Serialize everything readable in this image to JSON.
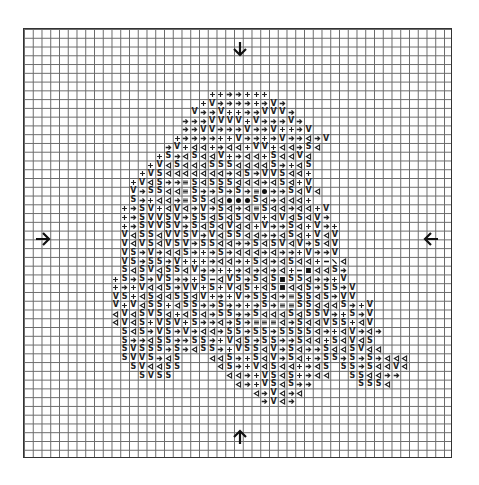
{
  "chart": {
    "cols": 49,
    "rows": 49,
    "start_row": 7,
    "legend_symbols": {
      "+": "plus-symbol",
      ">": "arrow-right-symbol",
      "V": "v-symbol",
      "<": "triangle-left-symbol",
      "S": "s-symbol",
      "H": "hash-symbol",
      "o": "dot-symbol",
      "#": "square-symbol",
      "-": "dash-symbol",
      "\\": "slash-symbol"
    },
    "pattern": [
      ".....................++>>+++",
      "....................+V>>>>+>V>",
      "...................V>>V++>>VVV>",
      "..................>>>VVVV+V>>>V>",
      "..................>>VV>>>V>>V++>V",
      ".................+>>>>++V>>+>V>><>V",
      "................>V+<<+><<+VV+<<>S<",
      "...............+S><S<<V+><<+S<<V<",
      "..............+V<S<<<SSS<<<<S>+<S",
      ".............+VS<<<<<<<><S>VVS<<+",
      "............+V<S>>HS<SSS<<<><S<+V",
      "............V>SS<<HS>>S>S>Ho>>S<V<",
      "............S>+<<>HSS<<oooS<><<<+",
      "...........+>SV+<V<>V>S<><HS<<><<+V",
      "...........+>SVVSV>SS<S<S<V+<V<S<V>",
      "...........+>SVVSV>S<S<V<<+V>>S<+V>+",
      "...........V<SS<VVSV>V<SS<<>><S<+V<V",
      "...........V<VS<VSV>SS<<>>S<SV<V>S<V",
      "...........VS>V><<S>+>S><<<><>>+V>>V",
      "...........VS>SS>V+++><<>+S<><S<<+-\\<",
      "...........S<SV<SS<V>>++><><><+-#<<S>",
      "..........+S>S>VS>>+S-<VS>S<S#SS<>>+V",
      "..........+>+V<<S>VV+S+V<S+<S#<<S>SS>V",
      "..........VS+<S<<SS<V+>+V>SS<>HSS<S>VV",
      "..........V+V<SS+<SS>>S>>+>S>HHSS<<<S>+V",
      "..........<V<SVS<+<S<>SS>>S<<<S<SSV>+S>V",
      "..........<V<S+VSV+S>><>S>HHH<>S<<VSS+<V",
      "...........S<S>VS>V><<>SS>SS>SSSS<>+<V><>",
      "...........S>><SS>>SS>+V<S>SS>>S<<+S<V<S",
      "...........SVSSS>S><SS>+VSS<V>S<>>S<<SV<<",
      "...........SVVS><S...<<S>+S<V>S<+>SS>S>S><<<",
      "............SV<<SS....<S>+V<S<<+><S.SS>S<<V<",
      ".............SVSS......<<>+VS<S+><<..SS<<>>",
      "........................<>+VS<S>>.....SSS<",
      "..........................<>V<><",
      "...........................>V<>"
    ],
    "markers": {
      "top": "arrow-down",
      "bottom": "arrow-up",
      "left": "arrow-right",
      "right": "arrow-left"
    }
  }
}
